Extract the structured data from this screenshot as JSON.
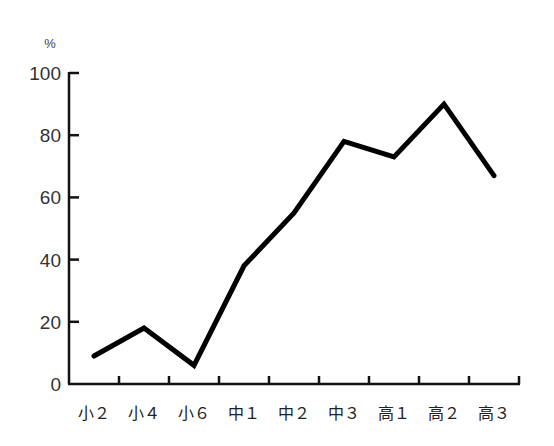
{
  "chart_data": {
    "type": "line",
    "title": "",
    "xlabel": "",
    "ylabel": "%",
    "unit_label": "%",
    "categories": [
      "小２",
      "小４",
      "小６",
      "中１",
      "中２",
      "中３",
      "高１",
      "高２",
      "高３"
    ],
    "values": [
      9,
      18,
      6,
      38,
      55,
      78,
      73,
      90,
      67
    ],
    "ylim": [
      0,
      100
    ],
    "yticks": [
      0,
      20,
      40,
      60,
      80,
      100
    ],
    "grid": false,
    "legend": null,
    "line_color": "#000000"
  }
}
